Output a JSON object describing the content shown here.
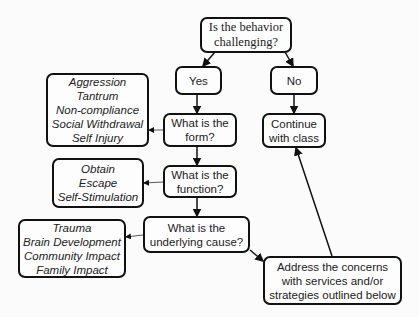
{
  "diagram": {
    "root": {
      "lines": [
        "Is the behavior",
        "challenging?"
      ]
    },
    "yes": {
      "label": "Yes"
    },
    "no": {
      "label": "No"
    },
    "continue": {
      "lines": [
        "Continue",
        "with class"
      ]
    },
    "form_question": {
      "lines": [
        "What is the",
        "form?"
      ]
    },
    "function_question": {
      "lines": [
        "What is the",
        "function?"
      ]
    },
    "cause_question": {
      "lines": [
        "What is the",
        "underlying cause?"
      ]
    },
    "address": {
      "lines": [
        "Address the concerns",
        "with services and/or",
        "strategies outlined below"
      ]
    },
    "forms": {
      "items": [
        "Aggression",
        "Tantrum",
        "Non-compliance",
        "Social Withdrawal",
        "Self Injury"
      ]
    },
    "functions": {
      "items": [
        "Obtain",
        "Escape",
        "Self-Stimulation"
      ]
    },
    "causes": {
      "items": [
        "Trauma",
        "Brain Development",
        "Community Impact",
        "Family Impact"
      ]
    }
  }
}
